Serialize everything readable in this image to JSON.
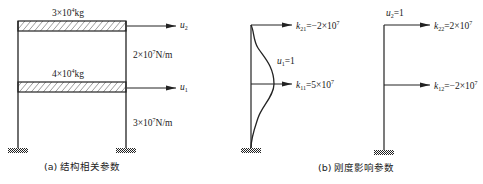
{
  "figure_a": {
    "caption": "(a) 结构相关参数",
    "top_mass": {
      "coef": "3×10",
      "exp": "4",
      "unit": "kg"
    },
    "mid_mass": {
      "coef": "4×10",
      "exp": "4",
      "unit": "kg"
    },
    "upper_stiffness": {
      "coef": "2×10",
      "exp": "7",
      "unit": "N/m"
    },
    "lower_stiffness": {
      "coef": "3×10",
      "exp": "7",
      "unit": "N/m"
    },
    "dof_top": {
      "sym": "u",
      "sub": "2"
    },
    "dof_mid": {
      "sym": "u",
      "sub": "1"
    }
  },
  "figure_b": {
    "caption": "(b) 刚度影响参数",
    "case1": {
      "disp": {
        "sym": "u",
        "sub": "1",
        "val": "=1"
      },
      "k_top": {
        "sym": "k",
        "sub": "21",
        "val": "=−2×10",
        "exp": "7"
      },
      "k_mid": {
        "sym": "k",
        "sub": "11",
        "val": "=5×10",
        "exp": "7"
      }
    },
    "case2": {
      "disp": {
        "sym": "u",
        "sub": "2",
        "val": "=1"
      },
      "k_top": {
        "sym": "k",
        "sub": "22",
        "val": "=2×10",
        "exp": "7"
      },
      "k_mid": {
        "sym": "k",
        "sub": "12",
        "val": "=−2×10",
        "exp": "7"
      }
    }
  },
  "colors": {
    "line": "#222222",
    "background": "#ffffff"
  }
}
